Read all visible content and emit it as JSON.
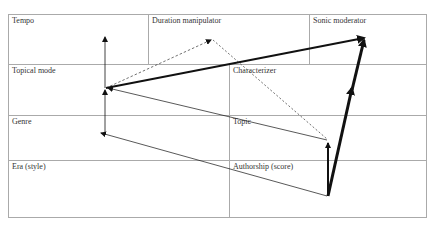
{
  "diagram": {
    "rows": [
      {
        "cells": [
          {
            "label": "Tempo"
          },
          {
            "label": "Duration manipulator"
          },
          {
            "label": "Sonic moderator"
          }
        ]
      },
      {
        "cells": [
          {
            "label": "Topical mode"
          },
          {
            "label": "Characterizer"
          }
        ]
      },
      {
        "cells": [
          {
            "label": "Genre"
          },
          {
            "label": "Topic"
          }
        ]
      },
      {
        "cells": [
          {
            "label": "Era (style)"
          },
          {
            "label": "Authorship (score)"
          }
        ]
      }
    ],
    "colors": {
      "border": "#aaaaaa",
      "arrow": "#111111",
      "text": "#333333"
    }
  }
}
